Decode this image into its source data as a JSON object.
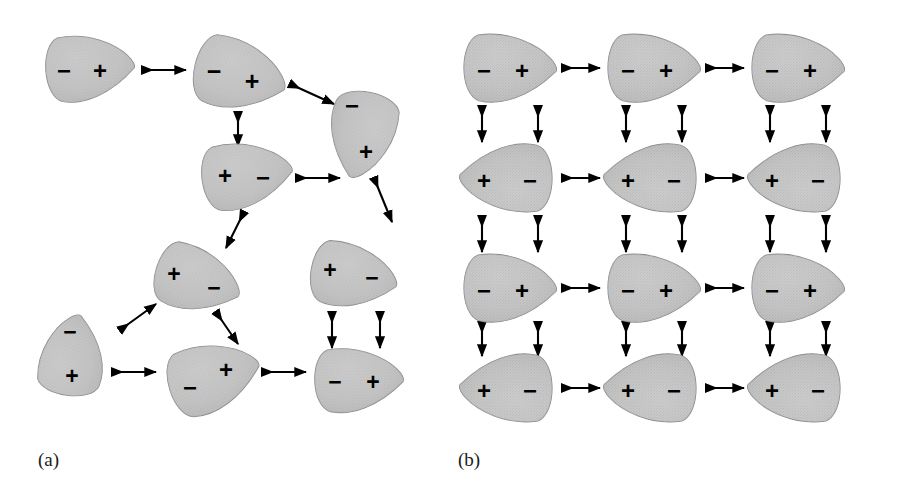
{
  "figure": {
    "width": 900,
    "height": 492,
    "background": "#ffffff",
    "shape_fill": "#c2c2c2",
    "shape_edge": "#8a8a8a",
    "arrow_color": "#000000",
    "sign_color": "#000000",
    "sign_plus": "+",
    "sign_minus": "−"
  },
  "panels": [
    {
      "id": "a",
      "label": "(a)",
      "label_x": 38,
      "label_y": 466,
      "state": "disordered",
      "dipoles": [
        {
          "name": "dipole-a1",
          "cx": 88,
          "cy": 68,
          "rx": 46,
          "ry": 32,
          "rot": -4,
          "minus_dx": -24,
          "minus_dy": 2,
          "plus_dx": 12,
          "plus_dy": 2
        },
        {
          "name": "dipole-a2",
          "cx": 238,
          "cy": 75,
          "rx": 48,
          "ry": 34,
          "rot": 14,
          "minus_dx": -24,
          "minus_dy": -4,
          "plus_dx": 14,
          "plus_dy": 6
        },
        {
          "name": "dipole-a3",
          "cx": 362,
          "cy": 133,
          "rx": 45,
          "ry": 32,
          "rot": 102,
          "minus_dx": -10,
          "minus_dy": -28,
          "plus_dx": 4,
          "plus_dy": 18
        },
        {
          "name": "dipole-a4",
          "cx": 245,
          "cy": 175,
          "rx": 47,
          "ry": 32,
          "rot": -8,
          "minus_dx": 18,
          "minus_dy": 2,
          "plus_dx": -20,
          "plus_dy": 0
        },
        {
          "name": "dipole-a5",
          "cx": 196,
          "cy": 280,
          "rx": 45,
          "ry": 31,
          "rot": 18,
          "minus_dx": 18,
          "minus_dy": 8,
          "plus_dx": -22,
          "plus_dy": -6
        },
        {
          "name": "dipole-a6",
          "cx": 352,
          "cy": 276,
          "rx": 45,
          "ry": 31,
          "rot": 10,
          "minus_dx": 20,
          "minus_dy": 2,
          "plus_dx": -22,
          "plus_dy": -6
        },
        {
          "name": "dipole-a7",
          "cx": 72,
          "cy": 357,
          "rx": 42,
          "ry": 31,
          "rot": -82,
          "minus_dx": -2,
          "minus_dy": -25,
          "plus_dx": 0,
          "plus_dy": 19
        },
        {
          "name": "dipole-a8",
          "cx": 212,
          "cy": 377,
          "rx": 48,
          "ry": 33,
          "rot": -17,
          "minus_dx": -22,
          "minus_dy": 10,
          "plus_dx": 14,
          "plus_dy": -8
        },
        {
          "name": "dipole-a9",
          "cx": 357,
          "cy": 380,
          "rx": 46,
          "ry": 31,
          "rot": -2,
          "minus_dx": -22,
          "minus_dy": 2,
          "plus_dx": 16,
          "plus_dy": 2
        }
      ],
      "arrows": [
        {
          "name": "arrow-a-1",
          "x1": 142,
          "y1": 70,
          "x2": 186,
          "y2": 70
        },
        {
          "name": "arrow-a-2",
          "x1": 290,
          "y1": 84,
          "x2": 334,
          "y2": 104
        },
        {
          "name": "arrow-a-3",
          "x1": 238,
          "y1": 112,
          "x2": 238,
          "y2": 146
        },
        {
          "name": "arrow-a-4",
          "x1": 296,
          "y1": 178,
          "x2": 340,
          "y2": 178
        },
        {
          "name": "arrow-a-5",
          "x1": 374,
          "y1": 178,
          "x2": 392,
          "y2": 222
        },
        {
          "name": "arrow-a-6",
          "x1": 244,
          "y1": 212,
          "x2": 226,
          "y2": 248
        },
        {
          "name": "arrow-a-7",
          "x1": 120,
          "y1": 330,
          "x2": 156,
          "y2": 304
        },
        {
          "name": "arrow-a-8",
          "x1": 216,
          "y1": 312,
          "x2": 238,
          "y2": 344
        },
        {
          "name": "arrow-a-9",
          "x1": 112,
          "y1": 372,
          "x2": 156,
          "y2": 372
        },
        {
          "name": "arrow-a-10",
          "x1": 262,
          "y1": 372,
          "x2": 306,
          "y2": 372
        },
        {
          "name": "arrow-a-11",
          "x1": 332,
          "y1": 312,
          "x2": 332,
          "y2": 348
        },
        {
          "name": "arrow-a-12",
          "x1": 380,
          "y1": 312,
          "x2": 380,
          "y2": 348
        }
      ]
    },
    {
      "id": "b",
      "label": "(b)",
      "label_x": 458,
      "label_y": 466,
      "state": "ordered",
      "grid": {
        "columns": 3,
        "rows": 4,
        "col_x": [
          508,
          652,
          796
        ],
        "row_y": [
          68,
          178,
          288,
          388
        ],
        "rx": 48,
        "ry": 33
      },
      "row_polarity": [
        "minus-plus",
        "plus-minus",
        "minus-plus",
        "plus-minus"
      ],
      "dipoles": [
        {
          "name": "dipole-b-r1c1",
          "cx": 508,
          "cy": 68,
          "rot": 0,
          "left": "−",
          "right": "+"
        },
        {
          "name": "dipole-b-r1c2",
          "cx": 652,
          "cy": 68,
          "rot": 0,
          "left": "−",
          "right": "+"
        },
        {
          "name": "dipole-b-r1c3",
          "cx": 796,
          "cy": 68,
          "rot": 0,
          "left": "−",
          "right": "+"
        },
        {
          "name": "dipole-b-r2c1",
          "cx": 508,
          "cy": 178,
          "rot": 180,
          "left": "+",
          "right": "−"
        },
        {
          "name": "dipole-b-r2c2",
          "cx": 652,
          "cy": 178,
          "rot": 180,
          "left": "+",
          "right": "−"
        },
        {
          "name": "dipole-b-r2c3",
          "cx": 796,
          "cy": 178,
          "rot": 180,
          "left": "+",
          "right": "−"
        },
        {
          "name": "dipole-b-r3c1",
          "cx": 508,
          "cy": 288,
          "rot": 0,
          "left": "−",
          "right": "+"
        },
        {
          "name": "dipole-b-r3c2",
          "cx": 652,
          "cy": 288,
          "rot": 0,
          "left": "−",
          "right": "+"
        },
        {
          "name": "dipole-b-r3c3",
          "cx": 796,
          "cy": 288,
          "rot": 0,
          "left": "−",
          "right": "+"
        },
        {
          "name": "dipole-b-r4c1",
          "cx": 508,
          "cy": 388,
          "rot": 180,
          "left": "+",
          "right": "−"
        },
        {
          "name": "dipole-b-r4c2",
          "cx": 652,
          "cy": 388,
          "rot": 180,
          "left": "+",
          "right": "−"
        },
        {
          "name": "dipole-b-r4c3",
          "cx": 796,
          "cy": 388,
          "rot": 180,
          "left": "+",
          "right": "−"
        }
      ],
      "horizontal_arrow_rows": [
        68,
        178,
        288,
        388
      ],
      "horizontal_arrow_gaps": [
        [
          562,
          600
        ],
        [
          706,
          744
        ]
      ],
      "vertical_arrow_cols": [
        482,
        538,
        626,
        682,
        770,
        826
      ],
      "vertical_arrow_gaps": [
        [
          106,
          142
        ],
        [
          216,
          252
        ],
        [
          322,
          356
        ]
      ]
    }
  ]
}
